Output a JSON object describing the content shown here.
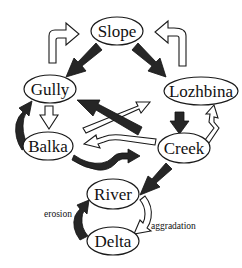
{
  "diagram": {
    "nodes": {
      "slope": "Slope",
      "gully": "Gully",
      "lozhbina": "Lozhbina",
      "balka": "Balka",
      "creek": "Creek",
      "river": "River",
      "delta": "Delta"
    },
    "annotations": {
      "erosion": "erosion",
      "aggradation": "aggradation"
    },
    "edges": [
      {
        "from": "Slope",
        "to": "Gully",
        "style": "dark"
      },
      {
        "from": "Slope",
        "to": "Lozhbina",
        "style": "dark"
      },
      {
        "from": "Gully",
        "to": "Slope",
        "style": "light"
      },
      {
        "from": "Lozhbina",
        "to": "Slope",
        "style": "light"
      },
      {
        "from": "Gully",
        "to": "Balka",
        "style": "light"
      },
      {
        "from": "Balka",
        "to": "Gully",
        "style": "dark"
      },
      {
        "from": "Lozhbina",
        "to": "Creek",
        "style": "dark"
      },
      {
        "from": "Creek",
        "to": "Lozhbina",
        "style": "light"
      },
      {
        "from": "Creek",
        "to": "Gully",
        "style": "dark"
      },
      {
        "from": "Balka",
        "to": "Lozhbina",
        "style": "light"
      },
      {
        "from": "Creek",
        "to": "Balka",
        "style": "light"
      },
      {
        "from": "Balka",
        "to": "Creek",
        "style": "dark"
      },
      {
        "from": "Creek",
        "to": "River",
        "style": "dark"
      },
      {
        "from": "River",
        "to": "Delta",
        "style": "light"
      },
      {
        "from": "Delta",
        "to": "River",
        "style": "dark"
      }
    ],
    "colors": {
      "dark_arrow": "#262626",
      "light_arrow": "#ffffff",
      "outline": "#1a1a1a"
    }
  }
}
